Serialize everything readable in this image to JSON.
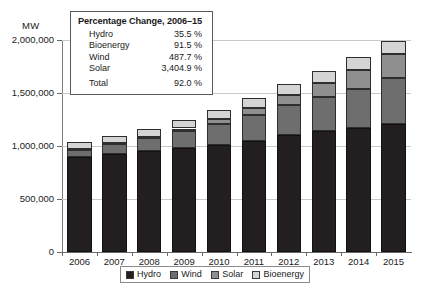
{
  "chart_data": {
    "type": "bar",
    "stacked": true,
    "title": "",
    "xlabel": "",
    "ylabel": "MW",
    "ylim": [
      0,
      2000000
    ],
    "yticks": [
      0,
      500000,
      1000000,
      1500000,
      2000000
    ],
    "ytick_labels": [
      "0",
      "500,000",
      "1,000,000",
      "1,500,000",
      "2,000,000"
    ],
    "grid": true,
    "legend_position": "bottom",
    "categories": [
      "2006",
      "2007",
      "2008",
      "2009",
      "2010",
      "2011",
      "2012",
      "2013",
      "2014",
      "2015"
    ],
    "series": [
      {
        "name": "Hydro",
        "color": "#231f20",
        "values": [
          892000,
          922000,
          950000,
          982000,
          1012000,
          1050000,
          1100000,
          1140000,
          1172000,
          1209000
        ]
      },
      {
        "name": "Wind",
        "color": "#6e6e6e",
        "values": [
          74000,
          94000,
          121000,
          159000,
          198000,
          238000,
          283000,
          319000,
          370000,
          433000
        ]
      },
      {
        "name": "Solar",
        "color": "#8f8f8f",
        "values": [
          6000,
          9000,
          16000,
          24000,
          41000,
          71000,
          101000,
          138000,
          178000,
          222000
        ]
      },
      {
        "name": "Bioenergy",
        "color": "#d4d4d4",
        "values": [
          66000,
          70000,
          75000,
          80000,
          86000,
          93000,
          100000,
          108000,
          116000,
          127000
        ]
      }
    ],
    "totals": [
      1038000,
      1095000,
      1162000,
      1245000,
      1337000,
      1452000,
      1584000,
      1705000,
      1836000,
      1991000
    ]
  },
  "axis": {
    "unit_label": "MW"
  },
  "callout": {
    "title": "Percentage Change, 2006–15",
    "rows": [
      {
        "label": "Hydro",
        "value": "35.5 %"
      },
      {
        "label": "Bioenergy",
        "value": "91.5 %"
      },
      {
        "label": "Wind",
        "value": "487.7 %"
      },
      {
        "label": "Solar",
        "value": "3,404.9 %"
      }
    ],
    "total": {
      "label": "Total",
      "value": "92.0 %"
    }
  },
  "legend": {
    "items": [
      {
        "label": "Hydro",
        "color": "#231f20"
      },
      {
        "label": "Wind",
        "color": "#6e6e6e"
      },
      {
        "label": "Solar",
        "color": "#8f8f8f"
      },
      {
        "label": "Bioenergy",
        "color": "#d4d4d4"
      }
    ]
  }
}
